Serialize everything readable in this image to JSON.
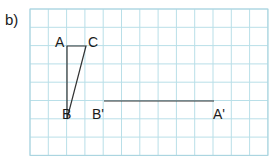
{
  "part_label": "b)",
  "grid": {
    "x0": 30,
    "y0": 9,
    "cols": 13,
    "rows": 8,
    "cell": 18.3,
    "line_color": "#b9dfe8",
    "border_color": "#a9d4df"
  },
  "shape": {
    "points": {
      "A": {
        "label": "A",
        "x": 67,
        "y": 46
      },
      "C": {
        "label": "C",
        "x": 86,
        "y": 46
      },
      "B": {
        "label": "B",
        "x": 67,
        "y": 119
      }
    },
    "image_segment": {
      "B_prime": {
        "label": "B'",
        "x": 104,
        "y": 101
      },
      "A_prime": {
        "label": "A'",
        "x": 214,
        "y": 101
      }
    },
    "line_color": "#333333"
  }
}
